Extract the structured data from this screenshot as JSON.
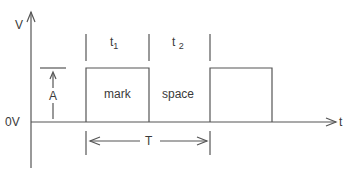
{
  "diagram": {
    "title": "",
    "axes": {
      "y_label": "V",
      "x_label": "t",
      "origin_label": "0V"
    },
    "segments": {
      "t1": {
        "base": "t",
        "sub": "1"
      },
      "t2": {
        "base": "t",
        "sub": "2"
      }
    },
    "regions": {
      "mark": "mark",
      "space": "space"
    },
    "amplitude_label": "A",
    "period_label": "T",
    "colors": {
      "line": "#555555",
      "text": "#3a3a3a",
      "background": "#ffffff"
    }
  }
}
